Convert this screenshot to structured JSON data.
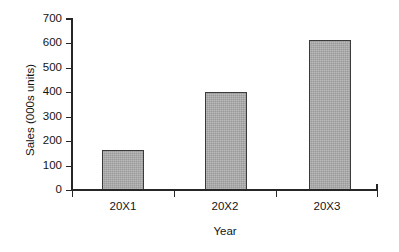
{
  "chart_data": {
    "type": "bar",
    "title": "",
    "subtitle": "",
    "xlabel": "Year",
    "ylabel": "Sales (000s units)",
    "categories": [
      "20X1",
      "20X2",
      "20X3"
    ],
    "values": [
      165,
      400,
      615
    ],
    "series": [
      {
        "name": "Sales",
        "values": [
          165,
          400,
          615
        ]
      }
    ],
    "ylim": [
      0,
      700
    ],
    "ytick_values": [
      0,
      100,
      200,
      300,
      400,
      500,
      600,
      700
    ],
    "ytick_labels": [
      "0",
      "100",
      "200",
      "300",
      "400",
      "500",
      "600",
      "700"
    ],
    "ytick_step": 100,
    "grid": false,
    "legend": false,
    "legend_position": "none",
    "annotations": [],
    "bar_fill_color": "#a9a9a9",
    "bar_border_color": "#3a3a3a",
    "axis_color": "#262626",
    "background_color": "#ffffff",
    "text_color": "#141414"
  },
  "axes": {
    "y_title": "Sales (000s units)",
    "x_title": "Year",
    "y_labels": [
      {
        "value": "700"
      },
      {
        "value": "600"
      },
      {
        "value": "500"
      },
      {
        "value": "400"
      },
      {
        "value": "300"
      },
      {
        "value": "200"
      },
      {
        "value": "100"
      },
      {
        "value": "0"
      }
    ],
    "x_labels": [
      {
        "value": "20X1"
      },
      {
        "value": "20X2"
      },
      {
        "value": "20X3"
      }
    ]
  }
}
